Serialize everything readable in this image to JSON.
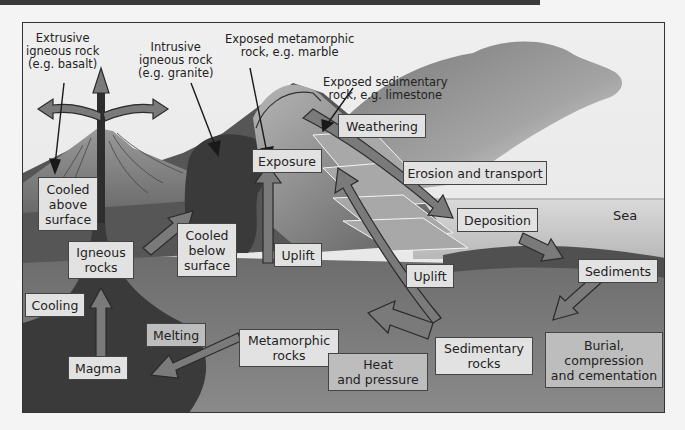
{
  "diagram": {
    "callouts": {
      "extrusive": "Extrusive\nigneous rock\n(e.g. basalt)",
      "intrusive": "Intrusive\nigneous rock\n(e.g. granite)",
      "exposed_metamorphic": "Exposed metamorphic\nrock, e.g. marble",
      "exposed_sedimentary": "Exposed sedimentary\nrock, e.g. limestone"
    },
    "stages": {
      "weathering": "Weathering",
      "erosion": "Erosion and transport",
      "deposition": "Deposition",
      "sediments": "Sediments",
      "exposure": "Exposure",
      "cooled_above": "Cooled\nabove\nsurface",
      "cooled_below": "Cooled\nbelow\nsurface",
      "igneous_rocks": "Igneous\nrocks",
      "uplift_1": "Uplift",
      "uplift_2": "Uplift",
      "cooling": "Cooling",
      "melting": "Melting",
      "magma": "Magma",
      "metamorphic_rocks": "Metamorphic\nrocks",
      "heat_pressure": "Heat\nand pressure",
      "sedimentary_rocks": "Sedimentary\nrocks",
      "burial": "Burial,\ncompression\nand cementation"
    },
    "sea_label": "Sea",
    "colors": {
      "sky": "#ececec",
      "cloud": "#8a8a8a",
      "ground": "#6e6e6e",
      "deep_ground": "#7d7d7d",
      "magma": "#3c3c3c",
      "arrow": "#7a7a7a",
      "sea": "#d2d2d2"
    }
  }
}
